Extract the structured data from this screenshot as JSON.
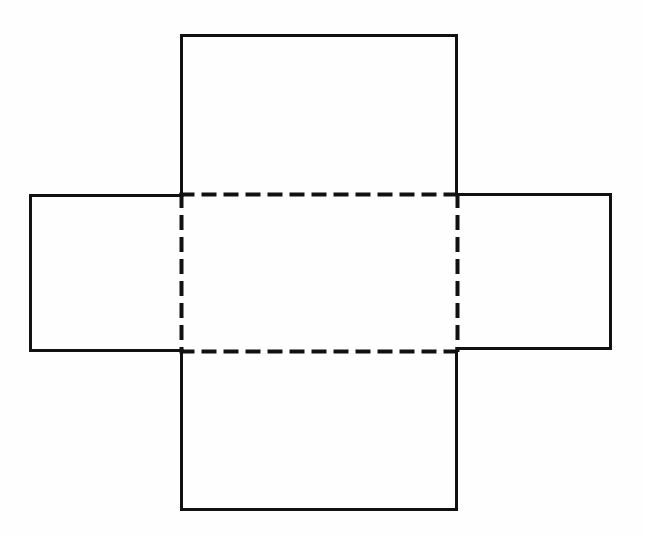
{
  "page": {
    "background_color": "#fefefe",
    "width": 645,
    "height": 537,
    "title": "Net of a rectangular box (cross-shaped unfolding)"
  },
  "diagram": {
    "name": "box-net-cross",
    "stroke_color": "#111111",
    "solid_stroke_width": 3,
    "dashed_stroke_width": 4,
    "dash_pattern": "15 7",
    "shapes": [
      {
        "id": "top-flap",
        "label": "Top flap",
        "line_style": "solid",
        "x": 180,
        "y": 34,
        "width": 278,
        "height": 160,
        "open_edge": "bottom"
      },
      {
        "id": "left-flap",
        "label": "Left flap",
        "line_style": "solid",
        "x": 29,
        "y": 194,
        "width": 153,
        "height": 158,
        "open_edge": "right"
      },
      {
        "id": "right-flap",
        "label": "Right flap",
        "line_style": "solid",
        "x": 457,
        "y": 193,
        "width": 155,
        "height": 157,
        "open_edge": "left"
      },
      {
        "id": "bottom-flap",
        "label": "Bottom flap",
        "line_style": "solid",
        "x": 180,
        "y": 352,
        "width": 278,
        "height": 159,
        "open_edge": "top"
      },
      {
        "id": "center-base",
        "label": "Center base panel",
        "line_style": "dashed",
        "x": 181,
        "y": 194,
        "width": 276,
        "height": 157,
        "open_edge": "none"
      }
    ],
    "fold_lines": [
      {
        "id": "fold-top",
        "label": "Top fold line",
        "x1": 181,
        "y1": 194,
        "x2": 457,
        "y2": 194
      },
      {
        "id": "fold-bottom",
        "label": "Bottom fold line",
        "x1": 181,
        "y1": 351,
        "x2": 457,
        "y2": 351
      },
      {
        "id": "fold-left",
        "label": "Left fold line",
        "x1": 181,
        "y1": 194,
        "x2": 181,
        "y2": 351
      },
      {
        "id": "fold-right",
        "label": "Right fold line",
        "x1": 457,
        "y1": 194,
        "x2": 457,
        "y2": 351
      }
    ]
  }
}
